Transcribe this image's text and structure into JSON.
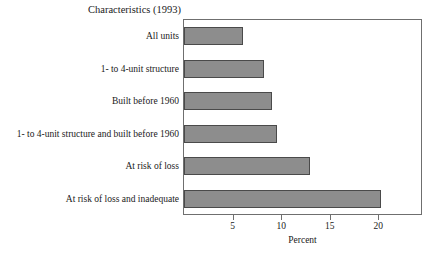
{
  "chart_data": {
    "type": "bar",
    "orientation": "horizontal",
    "title": "Characteristics (1993)",
    "xlabel": "Percent",
    "ylabel": "",
    "xlim": [
      0,
      24.5
    ],
    "xticks": [
      5,
      10,
      15,
      20
    ],
    "xticklabels": [
      "5",
      "10",
      "15",
      "20"
    ],
    "grid": false,
    "legend": false,
    "bar_color": "#8d8d8d",
    "bar_edge_color": "#4a4a4a",
    "frame_color": "#6f6f6f",
    "categories": [
      "All units",
      "1- to 4-unit structure",
      "Built before 1960",
      "1- to 4-unit structure and built before 1960",
      "At risk of loss",
      "At risk of loss and inadequate"
    ],
    "values": [
      6.1,
      8.2,
      9.1,
      9.6,
      13.0,
      20.3
    ]
  }
}
